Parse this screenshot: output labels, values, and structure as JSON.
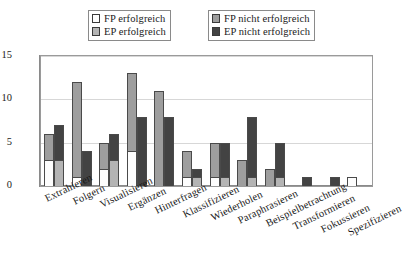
{
  "chart_data": {
    "type": "bar",
    "title": "",
    "xlabel": "",
    "ylabel": "",
    "ylim": [
      0,
      15
    ],
    "yticks": [
      0,
      5,
      10,
      15
    ],
    "grid": true,
    "stacked": true,
    "bar_pairs_per_category": 2,
    "legend_position": "top",
    "categories": [
      "Extrahieren",
      "Folgern",
      "Visualisieren",
      "Ergänzen",
      "Hinterfragen",
      "Klassifizieren",
      "Wiederholen",
      "Paraphrasieren",
      "Beispielbetrachtung",
      "Transformieren",
      "Fokussieren",
      "Spezifizieren"
    ],
    "series": [
      {
        "name": "FP erfolgreich",
        "key": "fp_ok",
        "color": "#fdfdfd",
        "stack": "FP",
        "values": [
          3,
          1,
          2,
          4,
          0,
          1,
          1,
          0,
          0,
          0,
          0,
          1
        ]
      },
      {
        "name": "FP nicht erfolgreich",
        "key": "fp_no",
        "color": "#9e9e9e",
        "stack": "FP",
        "values": [
          3,
          11,
          3,
          9,
          11,
          3,
          4,
          3,
          2,
          0,
          0,
          0
        ]
      },
      {
        "name": "EP erfolgreich",
        "key": "ep_ok",
        "color": "#b4b4b4",
        "stack": "EP",
        "values": [
          3,
          0,
          3,
          0,
          0,
          1,
          1,
          1,
          1,
          0,
          0,
          0
        ]
      },
      {
        "name": "EP nicht erfolgreich",
        "key": "ep_no",
        "color": "#434343",
        "stack": "EP",
        "values": [
          4,
          4,
          3,
          8,
          8,
          1,
          4,
          7,
          4,
          1,
          1,
          0
        ]
      }
    ],
    "stack_totals": {
      "FP": [
        6,
        12,
        5,
        13,
        11,
        4,
        5,
        3,
        2,
        0,
        0,
        1
      ],
      "EP": [
        7,
        4,
        6,
        8,
        8,
        2,
        5,
        8,
        5,
        1,
        1,
        0
      ]
    }
  },
  "legend": {
    "left_box": [
      {
        "label": "FP erfolgreich",
        "swatch": "#fdfdfd"
      },
      {
        "label": "EP erfolgreich",
        "swatch": "#b4b4b4"
      }
    ],
    "right_box": [
      {
        "label": "FP nicht erfolgreich",
        "swatch": "#9e9e9e"
      },
      {
        "label": "EP nicht erfolgreich",
        "swatch": "#434343"
      }
    ]
  },
  "axis": {
    "y_tick_labels": [
      "15",
      "10",
      "5",
      "0"
    ]
  }
}
